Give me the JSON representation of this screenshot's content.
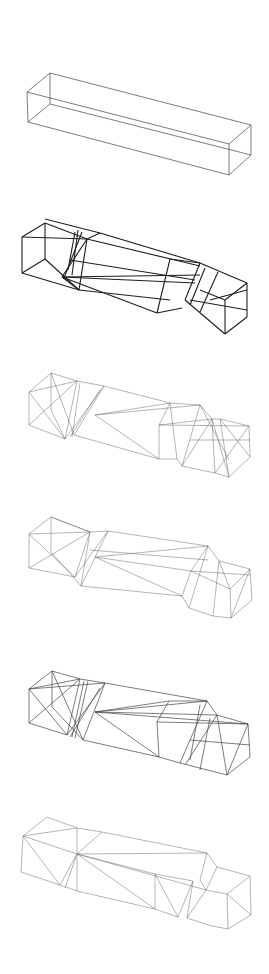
{
  "artwork": {
    "title": "",
    "description": "Six stacked wireframe drawings of an elongated rectangular box, progressively fractured into folded polyhedral segments",
    "line_color": "#333333",
    "background": "#ffffff"
  },
  "figures": [
    {
      "id": "box-1",
      "label": "intact-box",
      "lines": [
        [
          50,
          73,
          27,
          92
        ],
        [
          27,
          92,
          28,
          122
        ],
        [
          28,
          122,
          50,
          104
        ],
        [
          50,
          104,
          50,
          73
        ],
        [
          50,
          73,
          251,
          125
        ],
        [
          27,
          92,
          229,
          144
        ],
        [
          28,
          122,
          229,
          175
        ],
        [
          50,
          104,
          251,
          155
        ],
        [
          251,
          125,
          229,
          144
        ],
        [
          229,
          144,
          229,
          175
        ],
        [
          229,
          175,
          251,
          155
        ],
        [
          251,
          155,
          251,
          125
        ]
      ],
      "weight": "mid"
    },
    {
      "id": "box-2",
      "label": "folded-box-bold",
      "lines": [
        [
          22,
          237,
          45,
          223
        ],
        [
          45,
          223,
          87,
          239
        ],
        [
          87,
          239,
          22,
          237
        ],
        [
          22,
          237,
          22,
          273
        ],
        [
          22,
          273,
          79,
          290
        ],
        [
          79,
          290,
          87,
          239
        ],
        [
          45,
          223,
          45,
          259
        ],
        [
          45,
          259,
          22,
          273
        ],
        [
          45,
          259,
          79,
          290
        ],
        [
          45,
          219,
          100,
          233
        ],
        [
          100,
          233,
          87,
          239
        ],
        [
          87,
          239,
          62,
          277
        ],
        [
          62,
          277,
          79,
          290
        ],
        [
          100,
          233,
          200,
          263
        ],
        [
          87,
          239,
          200,
          266
        ],
        [
          62,
          277,
          157,
          313
        ],
        [
          79,
          290,
          170,
          300
        ],
        [
          62,
          277,
          195,
          283
        ],
        [
          62,
          277,
          200,
          275
        ],
        [
          70,
          260,
          195,
          280
        ],
        [
          170,
          259,
          157,
          313
        ],
        [
          157,
          313,
          182,
          308
        ],
        [
          170,
          259,
          200,
          263
        ],
        [
          200,
          263,
          247,
          283
        ],
        [
          200,
          263,
          185,
          300
        ],
        [
          185,
          300,
          225,
          334
        ],
        [
          225,
          334,
          247,
          317
        ],
        [
          247,
          317,
          247,
          283
        ],
        [
          205,
          268,
          190,
          305
        ],
        [
          218,
          272,
          200,
          312
        ],
        [
          210,
          300,
          247,
          290
        ],
        [
          190,
          300,
          247,
          310
        ],
        [
          225,
          334,
          225,
          300
        ],
        [
          225,
          300,
          247,
          283
        ],
        [
          200,
          290,
          225,
          300
        ],
        [
          75,
          232,
          68,
          270
        ],
        [
          78,
          230,
          72,
          275
        ],
        [
          82,
          232,
          64,
          278
        ]
      ],
      "weight": "bold"
    },
    {
      "id": "box-3",
      "label": "fractured-box-light",
      "lines": [
        [
          29,
          392,
          51,
          373
        ],
        [
          51,
          373,
          77,
          381
        ],
        [
          77,
          381,
          29,
          392
        ],
        [
          29,
          392,
          29,
          425
        ],
        [
          29,
          425,
          65,
          439
        ],
        [
          51,
          373,
          51,
          410
        ],
        [
          29,
          392,
          65,
          439
        ],
        [
          51,
          373,
          74,
          435
        ],
        [
          29,
          425,
          77,
          381
        ],
        [
          51,
          410,
          65,
          439
        ],
        [
          77,
          381,
          65,
          439
        ],
        [
          80,
          383,
          72,
          437
        ],
        [
          104,
          386,
          65,
          439
        ],
        [
          104,
          386,
          74,
          435
        ],
        [
          104,
          386,
          77,
          381
        ],
        [
          100,
          390,
          70,
          437
        ],
        [
          104,
          386,
          170,
          403
        ],
        [
          95,
          415,
          170,
          403
        ],
        [
          95,
          415,
          159,
          459
        ],
        [
          95,
          415,
          200,
          405
        ],
        [
          74,
          435,
          159,
          459
        ],
        [
          170,
          403,
          200,
          405
        ],
        [
          170,
          403,
          159,
          425
        ],
        [
          159,
          425,
          159,
          459
        ],
        [
          159,
          459,
          177,
          459
        ],
        [
          177,
          459,
          182,
          466
        ],
        [
          200,
          405,
          212,
          419
        ],
        [
          200,
          405,
          182,
          466
        ],
        [
          170,
          403,
          177,
          459
        ],
        [
          159,
          425,
          212,
          419
        ],
        [
          212,
          419,
          220,
          419
        ],
        [
          220,
          419,
          249,
          426
        ],
        [
          249,
          426,
          250,
          457
        ],
        [
          250,
          457,
          229,
          477
        ],
        [
          229,
          477,
          215,
          473
        ],
        [
          215,
          473,
          182,
          466
        ],
        [
          212,
          419,
          215,
          473
        ],
        [
          220,
          419,
          229,
          477
        ],
        [
          249,
          426,
          215,
          473
        ],
        [
          220,
          419,
          250,
          457
        ],
        [
          212,
          419,
          229,
          477
        ],
        [
          200,
          405,
          229,
          460
        ],
        [
          159,
          425,
          249,
          426
        ],
        [
          182,
          466,
          212,
          419
        ],
        [
          190,
          440,
          250,
          440
        ]
      ],
      "weight": "thin"
    },
    {
      "id": "box-4",
      "label": "fractured-box-sparse",
      "lines": [
        [
          29,
          534,
          51,
          517
        ],
        [
          51,
          517,
          90,
          532
        ],
        [
          90,
          532,
          29,
          534
        ],
        [
          29,
          534,
          29,
          568
        ],
        [
          29,
          568,
          75,
          577
        ],
        [
          51,
          517,
          51,
          552
        ],
        [
          29,
          534,
          75,
          577
        ],
        [
          51,
          517,
          90,
          532
        ],
        [
          29,
          568,
          90,
          532
        ],
        [
          51,
          552,
          81,
          586
        ],
        [
          90,
          532,
          75,
          577
        ],
        [
          90,
          532,
          81,
          586
        ],
        [
          108,
          531,
          75,
          577
        ],
        [
          108,
          531,
          90,
          532
        ],
        [
          108,
          531,
          81,
          586
        ],
        [
          108,
          531,
          208,
          546
        ],
        [
          95,
          557,
          208,
          546
        ],
        [
          95,
          557,
          182,
          596
        ],
        [
          95,
          557,
          191,
          571
        ],
        [
          81,
          586,
          182,
          596
        ],
        [
          90,
          550,
          208,
          560
        ],
        [
          208,
          546,
          219,
          561
        ],
        [
          208,
          546,
          191,
          571
        ],
        [
          191,
          571,
          182,
          596
        ],
        [
          182,
          596,
          189,
          608
        ],
        [
          208,
          546,
          189,
          608
        ],
        [
          219,
          561,
          250,
          569
        ],
        [
          250,
          569,
          252,
          600
        ],
        [
          252,
          600,
          231,
          618
        ],
        [
          231,
          618,
          213,
          616
        ],
        [
          213,
          616,
          189,
          608
        ],
        [
          219,
          561,
          230,
          589
        ],
        [
          230,
          589,
          231,
          618
        ],
        [
          250,
          569,
          230,
          589
        ],
        [
          250,
          569,
          231,
          618
        ],
        [
          219,
          561,
          213,
          616
        ],
        [
          191,
          571,
          230,
          589
        ],
        [
          191,
          571,
          250,
          575
        ]
      ],
      "weight": "thin"
    },
    {
      "id": "box-5",
      "label": "fractured-box-dense",
      "lines": [
        [
          29,
          689,
          52,
          671
        ],
        [
          52,
          671,
          80,
          679
        ],
        [
          80,
          679,
          29,
          689
        ],
        [
          29,
          689,
          29,
          723
        ],
        [
          29,
          723,
          67,
          735
        ],
        [
          52,
          671,
          52,
          707
        ],
        [
          29,
          689,
          67,
          735
        ],
        [
          52,
          671,
          83,
          740
        ],
        [
          29,
          723,
          80,
          679
        ],
        [
          52,
          707,
          83,
          740
        ],
        [
          29,
          689,
          105,
          683
        ],
        [
          80,
          679,
          67,
          735
        ],
        [
          84,
          681,
          72,
          737
        ],
        [
          88,
          681,
          75,
          738
        ],
        [
          105,
          683,
          67,
          735
        ],
        [
          105,
          683,
          83,
          740
        ],
        [
          105,
          683,
          80,
          679
        ],
        [
          100,
          688,
          70,
          737
        ],
        [
          105,
          683,
          207,
          701
        ],
        [
          95,
          712,
          169,
          701
        ],
        [
          95,
          712,
          159,
          757
        ],
        [
          95,
          712,
          207,
          701
        ],
        [
          83,
          740,
          159,
          757
        ],
        [
          95,
          712,
          217,
          715
        ],
        [
          95,
          712,
          248,
          724
        ],
        [
          169,
          701,
          207,
          701
        ],
        [
          169,
          701,
          157,
          722
        ],
        [
          157,
          722,
          159,
          757
        ],
        [
          159,
          757,
          180,
          763
        ],
        [
          180,
          763,
          227,
          775
        ],
        [
          207,
          701,
          217,
          715
        ],
        [
          207,
          701,
          180,
          763
        ],
        [
          217,
          715,
          248,
          724
        ],
        [
          248,
          724,
          250,
          757
        ],
        [
          250,
          757,
          227,
          775
        ],
        [
          217,
          715,
          227,
          775
        ],
        [
          248,
          724,
          227,
          775
        ],
        [
          217,
          715,
          185,
          765
        ],
        [
          200,
          705,
          190,
          760
        ],
        [
          210,
          718,
          200,
          770
        ],
        [
          157,
          722,
          248,
          724
        ],
        [
          190,
          740,
          250,
          745
        ]
      ],
      "weight": "mid"
    },
    {
      "id": "box-6",
      "label": "folded-planes-box",
      "lines": [
        [
          23,
          836,
          47,
          817
        ],
        [
          47,
          817,
          77,
          828
        ],
        [
          77,
          828,
          23,
          836
        ],
        [
          23,
          836,
          21,
          872
        ],
        [
          21,
          872,
          60,
          885
        ],
        [
          60,
          885,
          23,
          836
        ],
        [
          77,
          828,
          77,
          891
        ],
        [
          77,
          891,
          60,
          885
        ],
        [
          77,
          854,
          60,
          885
        ],
        [
          77,
          854,
          65,
          888
        ],
        [
          77,
          828,
          102,
          832
        ],
        [
          102,
          832,
          77,
          854
        ],
        [
          23,
          836,
          77,
          854
        ],
        [
          102,
          832,
          207,
          853
        ],
        [
          77,
          854,
          207,
          853
        ],
        [
          77,
          854,
          155,
          874
        ],
        [
          77,
          854,
          206,
          890
        ],
        [
          77,
          891,
          155,
          909
        ],
        [
          77,
          854,
          155,
          909
        ],
        [
          207,
          853,
          217,
          867
        ],
        [
          207,
          853,
          200,
          880
        ],
        [
          200,
          880,
          206,
          890
        ],
        [
          155,
          874,
          155,
          909
        ],
        [
          155,
          909,
          178,
          917
        ],
        [
          155,
          874,
          193,
          881
        ],
        [
          155,
          874,
          178,
          917
        ],
        [
          193,
          881,
          178,
          917
        ],
        [
          193,
          881,
          187,
          918
        ],
        [
          217,
          867,
          250,
          876
        ],
        [
          250,
          876,
          251,
          915
        ],
        [
          251,
          915,
          228,
          929
        ],
        [
          228,
          929,
          212,
          926
        ],
        [
          212,
          926,
          187,
          918
        ],
        [
          206,
          890,
          227,
          894
        ],
        [
          227,
          894,
          228,
          929
        ],
        [
          227,
          894,
          250,
          876
        ],
        [
          227,
          894,
          251,
          915
        ],
        [
          206,
          890,
          187,
          918
        ],
        [
          217,
          867,
          206,
          890
        ]
      ],
      "weight": "thin"
    }
  ]
}
